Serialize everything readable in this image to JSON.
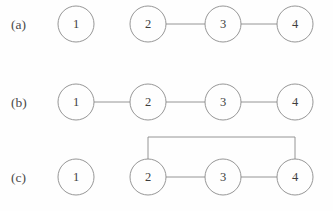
{
  "figure": {
    "background_color": "#fefefe",
    "stroke_color": "#8a8a8a",
    "text_color": "#3d3d3d",
    "label_color": "#4a4a4a",
    "node_radius": 18,
    "node_centers_x": [
      76,
      148,
      223,
      295
    ],
    "panels": [
      {
        "id": "a",
        "label": "(a)",
        "label_x": 11,
        "label_y": 29,
        "center_y": 24,
        "nodes": [
          {
            "id": "a1",
            "label": "1",
            "x": 76,
            "y": 24
          },
          {
            "id": "a2",
            "label": "2",
            "x": 148,
            "y": 24
          },
          {
            "id": "a3",
            "label": "3",
            "x": 223,
            "y": 24
          },
          {
            "id": "a4",
            "label": "4",
            "x": 295,
            "y": 24
          }
        ],
        "edges": [
          {
            "from": "a2",
            "to": "a3",
            "type": "straight"
          },
          {
            "from": "a3",
            "to": "a4",
            "type": "straight"
          }
        ]
      },
      {
        "id": "b",
        "label": "(b)",
        "label_x": 11,
        "label_y": 107,
        "center_y": 102,
        "nodes": [
          {
            "id": "b1",
            "label": "1",
            "x": 76,
            "y": 102
          },
          {
            "id": "b2",
            "label": "2",
            "x": 148,
            "y": 102
          },
          {
            "id": "b3",
            "label": "3",
            "x": 223,
            "y": 102
          },
          {
            "id": "b4",
            "label": "4",
            "x": 295,
            "y": 102
          }
        ],
        "edges": [
          {
            "from": "b1",
            "to": "b2",
            "type": "straight"
          },
          {
            "from": "b2",
            "to": "b3",
            "type": "straight"
          },
          {
            "from": "b3",
            "to": "b4",
            "type": "straight"
          }
        ]
      },
      {
        "id": "c",
        "label": "(c)",
        "label_x": 11,
        "label_y": 182,
        "center_y": 177,
        "arc_top_y": 137,
        "nodes": [
          {
            "id": "c1",
            "label": "1",
            "x": 76,
            "y": 177
          },
          {
            "id": "c2",
            "label": "2",
            "x": 148,
            "y": 177
          },
          {
            "id": "c3",
            "label": "3",
            "x": 223,
            "y": 177
          },
          {
            "id": "c4",
            "label": "4",
            "x": 295,
            "y": 177
          }
        ],
        "edges": [
          {
            "from": "c2",
            "to": "c3",
            "type": "straight"
          },
          {
            "from": "c3",
            "to": "c4",
            "type": "straight"
          },
          {
            "from": "c2",
            "to": "c4",
            "type": "bracket-top"
          }
        ]
      }
    ]
  }
}
